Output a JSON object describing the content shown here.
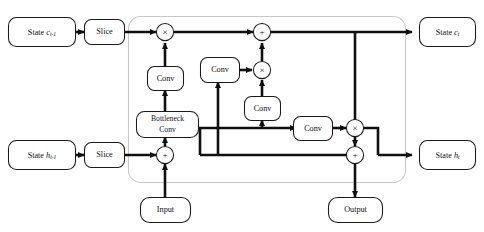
{
  "figure": {
    "kind": "neural-network-cell-diagram",
    "background_color": "#ffffff",
    "line_color": "#101010",
    "container_color": "#c9c9c9"
  },
  "nodes": {
    "state_c_prev": {
      "label": "State",
      "var": "c",
      "sub": "t-1",
      "full": "State c t-1"
    },
    "slice_top": {
      "label": "Slice"
    },
    "state_c_t": {
      "label": "State",
      "var": "c",
      "sub": "t",
      "full": "State c t"
    },
    "state_h_prev": {
      "label": "State",
      "var": "h",
      "sub": "t-1",
      "full": "State h t-1"
    },
    "slice_bottom": {
      "label": "Slice"
    },
    "state_h_t": {
      "label": "State",
      "var": "h",
      "sub": "t",
      "full": "State h t"
    },
    "input": {
      "label": "Input"
    },
    "output": {
      "label": "Output"
    },
    "bottleneck_conv": {
      "line1": "Bottleneck",
      "line2": "Conv"
    },
    "conv_forget": {
      "label": "Conv"
    },
    "conv_candidate": {
      "label": "Conv"
    },
    "conv_input_gate": {
      "label": "Conv"
    },
    "conv_output_gate": {
      "label": "Conv"
    }
  },
  "operators": {
    "mult_forget": {
      "symbol": "×",
      "name": "multiply"
    },
    "add_cell": {
      "symbol": "+",
      "name": "add"
    },
    "mult_input": {
      "symbol": "×",
      "name": "multiply"
    },
    "add_hidden_in": {
      "symbol": "+",
      "name": "add"
    },
    "mult_output": {
      "symbol": "×",
      "name": "multiply"
    },
    "add_hidden_out": {
      "symbol": "+",
      "name": "add"
    }
  }
}
